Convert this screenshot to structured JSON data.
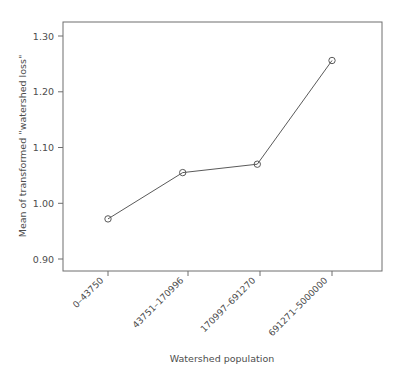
{
  "chart_data": {
    "type": "line",
    "title": "",
    "xlabel": "Watershed population",
    "ylabel": "Mean of transformed \"watershed loss\"",
    "categories": [
      "0–43750",
      "43751–170996",
      "170997–691270",
      "691271–5000000"
    ],
    "values": [
      0.972,
      1.055,
      1.07,
      1.256
    ],
    "series": [
      {
        "name": "Mean of transformed \"watershed loss\"",
        "values": [
          0.972,
          1.055,
          1.07,
          1.256
        ]
      }
    ],
    "ylim": [
      0.88,
      1.325
    ],
    "yticks": [
      0.9,
      1.0,
      1.1,
      1.2,
      1.3
    ],
    "ytick_labels": [
      "0.90",
      "1.00",
      "1.10",
      "1.20",
      "1.30"
    ],
    "xtick_labels": [
      "0–43750",
      "43751–170996",
      "170997–691270",
      "691271–5000000"
    ],
    "xtick_rotation": -45,
    "grid": false,
    "legend": false,
    "marker": "open-circle",
    "line_color": "#5a5a5a",
    "marker_color": "#5a5a5a",
    "frame_color": "#6e6e6e",
    "text_color": "#4d4d4d",
    "background": "#ffffff"
  },
  "axes": {
    "y": {
      "title": "Mean of transformed \"watershed loss\"",
      "ticks": [
        {
          "label": "1.30",
          "value": 1.3
        },
        {
          "label": "1.20",
          "value": 1.2
        },
        {
          "label": "1.10",
          "value": 1.1
        },
        {
          "label": "1.00",
          "value": 1.0
        },
        {
          "label": "0.90",
          "value": 0.9
        }
      ]
    },
    "x": {
      "title": "Watershed population",
      "ticks": [
        {
          "label": "0–43750"
        },
        {
          "label": "43751–170996"
        },
        {
          "label": "170997–691270"
        },
        {
          "label": "691271–5000000"
        }
      ]
    }
  }
}
